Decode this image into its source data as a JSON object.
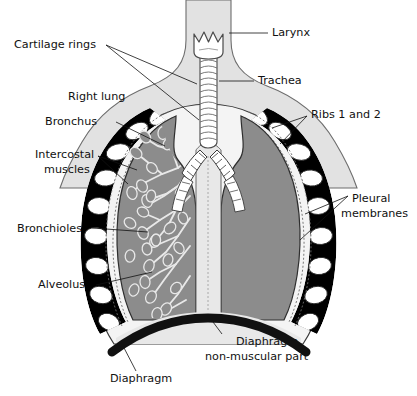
{
  "figure": {
    "type": "labelled-anatomical-diagram",
    "width": 417,
    "height": 396,
    "background": "#ffffff"
  },
  "colors": {
    "page_background": "#ffffff",
    "torso_fill": "#e2e2e2",
    "torso_outline": "#6d6d6d",
    "lung_fill": "#8c8c8c",
    "lung_outline": "#3a3a3a",
    "pleura_fill": "#f2f2f2",
    "rib_fill": "#ffffff",
    "intercostal_fill": "#000000",
    "trachea_fill": "#ffffff",
    "trachea_outline": "#4a4a4a",
    "mediastinum_fill": "#e8e8e8",
    "diaphragm_fill": "#111111",
    "diaphragm_nonmuscular_fill": "#e8e8e8",
    "label_text": "#111111",
    "leader_line": "#111111"
  },
  "labels": [
    {
      "id": "cartilage-rings",
      "text": "Cartilage rings",
      "x": 14,
      "y": 48,
      "anchor": "start",
      "lines": 1
    },
    {
      "id": "larynx",
      "text": "Larynx",
      "x": 272,
      "y": 36,
      "anchor": "start",
      "lines": 1
    },
    {
      "id": "trachea",
      "text": "Trachea",
      "x": 258,
      "y": 84,
      "anchor": "start",
      "lines": 1
    },
    {
      "id": "right-lung",
      "text": "Right lung",
      "x": 68,
      "y": 100,
      "anchor": "start",
      "lines": 1
    },
    {
      "id": "ribs-1-and-2",
      "text": "Ribs 1 and 2",
      "x": 311,
      "y": 118,
      "anchor": "start",
      "lines": 1
    },
    {
      "id": "bronchus",
      "text": "Bronchus",
      "x": 45,
      "y": 125,
      "anchor": "start",
      "lines": 1
    },
    {
      "id": "intercostal-muscles",
      "text": "Intercostal",
      "text2": "muscles",
      "x": 35,
      "y": 158,
      "anchor": "start",
      "lines": 2
    },
    {
      "id": "pleural-membranes",
      "text": "Pleural",
      "text2": "membranes",
      "x": 352,
      "y": 202,
      "anchor": "start",
      "lines": 2
    },
    {
      "id": "bronchioles",
      "text": "Bronchioles",
      "x": 17,
      "y": 232,
      "anchor": "start",
      "lines": 1
    },
    {
      "id": "alveolus",
      "text": "Alveolus",
      "x": 38,
      "y": 288,
      "anchor": "start",
      "lines": 1
    },
    {
      "id": "diaphragm-nonmuscular",
      "text": "Diaphragm",
      "text2": "non-muscular part",
      "x": 205,
      "y": 343,
      "anchor": "start",
      "lines": 2
    },
    {
      "id": "diaphragm",
      "text": "Diaphragm",
      "x": 110,
      "y": 380,
      "anchor": "start",
      "lines": 1
    }
  ],
  "structures": [
    {
      "id": "larynx",
      "name": "Larynx",
      "description": "Crown-shaped cartilage at top of trachea"
    },
    {
      "id": "trachea",
      "name": "Trachea",
      "description": "Vertical tube with C-shaped cartilage rings",
      "ring_count": 14
    },
    {
      "id": "right-lung",
      "name": "Right lung",
      "description": "Left side of image, viewer's left"
    },
    {
      "id": "left-lung",
      "name": "Left lung",
      "description": "Right side of image, viewer's right"
    },
    {
      "id": "ribs",
      "name": "Ribs 1 and 2",
      "description": "White oval rib cross-sections",
      "rib_count_per_side": 9
    },
    {
      "id": "intercostal-muscles",
      "name": "Intercostal muscles",
      "description": "Black wedges between ribs"
    },
    {
      "id": "pleural-membranes",
      "name": "Pleural membranes",
      "description": "Double dotted lining around each lung"
    },
    {
      "id": "bronchus",
      "name": "Bronchus",
      "description": "Main airway branching from trachea into each lung"
    },
    {
      "id": "bronchioles",
      "name": "Bronchioles",
      "description": "Fine branching airways inside lung"
    },
    {
      "id": "alveolus",
      "name": "Alveolus",
      "description": "Small sac at tips of bronchioles"
    },
    {
      "id": "diaphragm",
      "name": "Diaphragm",
      "description": "Thick black dome beneath the lungs"
    },
    {
      "id": "diaphragm-nonmuscular",
      "name": "Diaphragm non-muscular part",
      "description": "Pale central tendon of diaphragm"
    }
  ]
}
